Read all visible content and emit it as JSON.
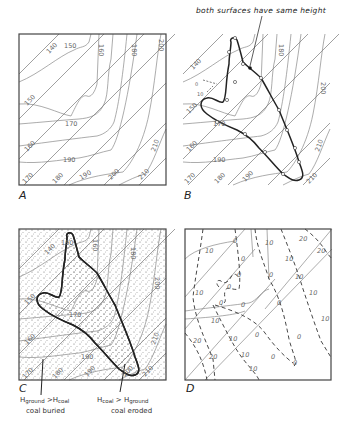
{
  "figure": {
    "annotation_top": "both surfaces have same height",
    "panels": [
      {
        "id": "A",
        "label": "A",
        "description": "Ground surface contours (oblique straight lines) and coal seam contours (wavy lines)"
      },
      {
        "id": "B",
        "label": "B",
        "description": "Outcrop line traced through intersections where both surfaces have same height"
      },
      {
        "id": "C",
        "label": "C",
        "description": "Stippled area where coal is buried; unstippled outcrop area where coal is eroded"
      },
      {
        "id": "D",
        "label": "D",
        "description": "Dashed isolines of height difference between ground and coal surfaces"
      }
    ],
    "captions": {
      "buried": {
        "line1_prefix": "H",
        "line1_sub1": "ground",
        "line1_mid": " >H",
        "line1_sub2": "coal",
        "line2": "coal buried"
      },
      "eroded": {
        "line1_prefix": "H",
        "line1_sub1": "coal",
        "line1_mid": " > H",
        "line1_sub2": "ground",
        "line2": "coal eroded"
      }
    },
    "contour_labels": {
      "ground": [
        "140",
        "150",
        "160",
        "170",
        "180",
        "190",
        "200",
        "210"
      ],
      "coal": [
        "150",
        "160",
        "170",
        "180",
        "190",
        "200",
        "210"
      ],
      "difference": [
        "0",
        "10",
        "20"
      ]
    },
    "colors": {
      "frame": "#444444",
      "contour": "#777777",
      "outcrop": "#222222",
      "stipple": "#555555"
    }
  }
}
